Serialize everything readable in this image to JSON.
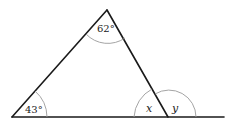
{
  "diagram": {
    "type": "triangle-exterior-angle",
    "angles": {
      "apex": "62°",
      "bottom_left": "43°",
      "interior_right": "x",
      "exterior_right": "y"
    }
  }
}
